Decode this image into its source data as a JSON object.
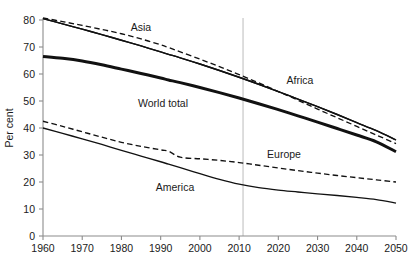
{
  "chart_data": {
    "type": "line",
    "title": "",
    "xlabel": "",
    "ylabel": "Per cent",
    "xlim": [
      1960,
      2050
    ],
    "ylim": [
      0,
      80
    ],
    "grid": false,
    "legend_position": "inline-labels",
    "xticks": [
      "1960",
      "1970",
      "1980",
      "1990",
      "2000",
      "2010",
      "2020",
      "2030",
      "2040",
      "2050"
    ],
    "yticks": [
      "0",
      "10",
      "20",
      "30",
      "40",
      "50",
      "60",
      "70",
      "80"
    ],
    "annotations": [
      {
        "text": "vertical reference line",
        "x": 2011
      }
    ],
    "x": [
      1960,
      1965,
      1970,
      1975,
      1980,
      1985,
      1990,
      1992,
      1995,
      2000,
      2005,
      2010,
      2015,
      2020,
      2025,
      2030,
      2035,
      2040,
      2045,
      2050
    ],
    "series": [
      {
        "name": "Asia",
        "label": "Asia",
        "style": "solid-thin",
        "values": [
          80.5,
          78.6,
          76.6,
          74.6,
          72.5,
          70.4,
          68.2,
          67.3,
          66.0,
          63.7,
          61.3,
          58.8,
          56.2,
          53.5,
          50.7,
          47.9,
          45.0,
          42.0,
          39.0,
          35.6
        ]
      },
      {
        "name": "Asia-dashed",
        "label": "Asia",
        "style": "dashed-thin",
        "values": [
          80.8,
          79.4,
          78.0,
          76.5,
          74.9,
          73.0,
          70.8,
          69.8,
          68.2,
          65.5,
          62.7,
          59.8,
          56.7,
          53.5,
          50.3,
          47.0,
          43.8,
          40.6,
          37.4,
          34.2
        ]
      },
      {
        "name": "World total",
        "label": "World total",
        "style": "solid-thick",
        "values": [
          66.5,
          65.8,
          64.8,
          63.4,
          61.8,
          60.2,
          58.5,
          57.8,
          56.8,
          55.0,
          53.1,
          51.1,
          49.0,
          46.8,
          44.5,
          42.2,
          39.8,
          37.4,
          34.9,
          31.2
        ]
      },
      {
        "name": "Africa",
        "label": "Africa",
        "style": "solid-thin",
        "values": [
          80.5,
          78.6,
          76.6,
          74.6,
          72.5,
          70.4,
          68.2,
          67.3,
          66.0,
          63.7,
          61.3,
          58.8,
          56.2,
          53.5,
          50.7,
          47.9,
          45.0,
          42.0,
          39.0,
          35.6
        ]
      },
      {
        "name": "Europe",
        "label": "Europe",
        "style": "dashed-thin",
        "values": [
          42.5,
          40.6,
          38.6,
          36.6,
          34.7,
          33.2,
          31.9,
          31.4,
          29.2,
          28.6,
          28.0,
          27.2,
          26.2,
          25.2,
          24.2,
          23.3,
          22.4,
          21.6,
          20.8,
          20.0
        ]
      },
      {
        "name": "America",
        "label": "America",
        "style": "solid-thin",
        "values": [
          40.0,
          38.0,
          36.0,
          33.9,
          31.7,
          29.6,
          27.5,
          26.6,
          25.3,
          23.1,
          21.0,
          19.2,
          17.9,
          17.0,
          16.3,
          15.6,
          15.0,
          14.3,
          13.5,
          12.2
        ]
      }
    ],
    "inline_labels": [
      {
        "name": "asia-label",
        "text": "Asia",
        "x_px": 141,
        "y_px": 31
      },
      {
        "name": "africa-label",
        "text": "Africa",
        "x_px": 300,
        "y_px": 84
      },
      {
        "name": "world-total-label",
        "text": "World total",
        "x_px": 163,
        "y_px": 107
      },
      {
        "name": "europe-label",
        "text": "Europe",
        "x_px": 284,
        "y_px": 158
      },
      {
        "name": "america-label",
        "text": "America",
        "x_px": 175,
        "y_px": 191
      }
    ]
  }
}
